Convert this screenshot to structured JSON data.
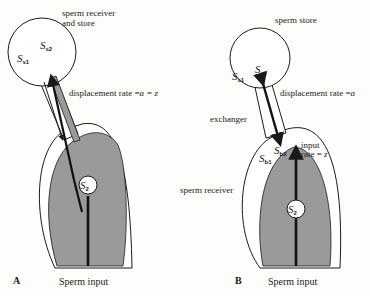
{
  "figure": {
    "panels": [
      {
        "id": "A",
        "panel_label": "A",
        "top_label_line1": "sperm receiver",
        "top_label_line2": "and store",
        "compartment_symbols": {
          "s1": {
            "base": "S",
            "sub": "s1"
          },
          "s2": {
            "base": "S",
            "sub": "s2"
          },
          "inner": {
            "base": "S",
            "sub": "2"
          }
        },
        "rate_label": "displacement rate =",
        "rate_expr": "a = z",
        "input_label": "Sperm input"
      },
      {
        "id": "B",
        "panel_label": "B",
        "top_label": "sperm store",
        "side_label": "sperm receiver",
        "duct_label": "exchanger",
        "compartment_symbols": {
          "s1": {
            "base": "S",
            "sub": "s1"
          },
          "s2": {
            "base": "S",
            "sub": "s2"
          },
          "b1": {
            "base": "S",
            "sub": "b1"
          },
          "b2": {
            "base": "S",
            "sub": "b2"
          },
          "inner": {
            "base": "S",
            "sub": "2"
          }
        },
        "rate_label": "displacement rate =",
        "rate_expr": "a",
        "input_rate_line1": "input",
        "input_rate_line2": "rate = ",
        "input_rate_expr": "z",
        "input_label": "Sperm input"
      }
    ],
    "colors": {
      "fill_gray": "#9a9a9a",
      "line": "#1a1a1a",
      "background": "#fdfdfb"
    }
  }
}
